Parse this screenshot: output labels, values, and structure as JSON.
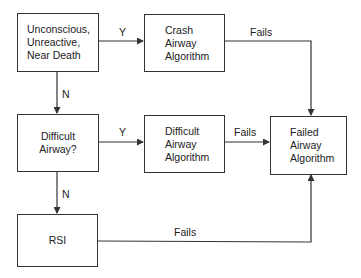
{
  "nodes": {
    "unconscious": {
      "label": "Unconscious,\nUnreactive,\nNear Death"
    },
    "crash": {
      "label": "Crash\nAirway\nAlgorithm"
    },
    "difficult_q": {
      "label": "Difficult\nAirway?"
    },
    "difficult_alg": {
      "label": "Difficult\nAirway\nAlgorithm"
    },
    "failed": {
      "label": "Failed\nAirway\nAlgorithm"
    },
    "rsi": {
      "label": "RSI"
    }
  },
  "edges": {
    "unconscious_to_crash": {
      "label": "Y"
    },
    "unconscious_to_difficult": {
      "label": "N"
    },
    "difficult_to_alg": {
      "label": "Y"
    },
    "difficult_to_rsi": {
      "label": "N"
    },
    "crash_to_failed": {
      "label": "Fails"
    },
    "difficult_alg_to_failed": {
      "label": "Fails"
    },
    "rsi_to_failed": {
      "label": "Fails"
    }
  },
  "colors": {
    "line": "#333333",
    "text": "#222222",
    "background": "#ffffff"
  }
}
